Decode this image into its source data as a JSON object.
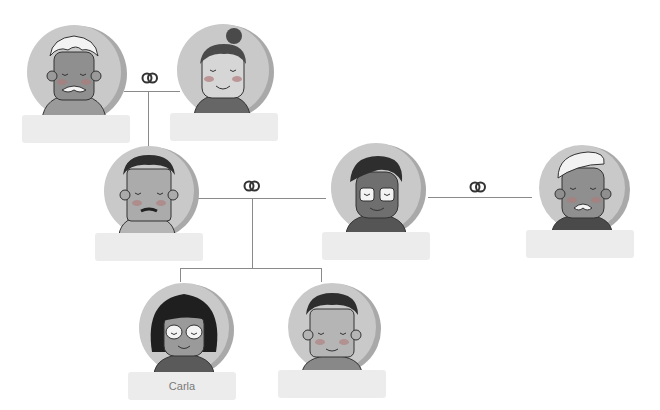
{
  "diagram": {
    "type": "family-tree",
    "colors": {
      "line": "#8a8a8a",
      "label_bg": "#ececec",
      "label_text": "#7a7a7a",
      "avatar_bg": "#c9c9c9",
      "avatar_shadow": "#a9a9a9"
    },
    "people": [
      {
        "id": "grandpa",
        "name": "",
        "hair": "white-curly",
        "mustache": true
      },
      {
        "id": "grandma",
        "name": "",
        "hair": "bun"
      },
      {
        "id": "father",
        "name": "",
        "hair": "dark-curly",
        "mustache": true
      },
      {
        "id": "mother",
        "name": "",
        "hair": "dark",
        "glasses": true
      },
      {
        "id": "stepfather",
        "name": "",
        "hair": "white-swept",
        "mustache": true
      },
      {
        "id": "daughter",
        "name": "Carla",
        "hair": "dark-bob",
        "glasses": true
      },
      {
        "id": "son",
        "name": "",
        "hair": "dark-curly"
      }
    ],
    "relations": [
      {
        "type": "marriage",
        "icon": "rings-icon",
        "between": [
          "grandpa",
          "grandma"
        ]
      },
      {
        "type": "marriage",
        "icon": "rings-icon",
        "between": [
          "father",
          "mother"
        ]
      },
      {
        "type": "marriage",
        "icon": "rings-icon",
        "between": [
          "mother",
          "stepfather"
        ]
      },
      {
        "type": "parent-child",
        "parents": [
          "grandpa",
          "grandma"
        ],
        "children": [
          "father"
        ]
      },
      {
        "type": "parent-child",
        "parents": [
          "father",
          "mother"
        ],
        "children": [
          "daughter",
          "son"
        ]
      }
    ]
  }
}
